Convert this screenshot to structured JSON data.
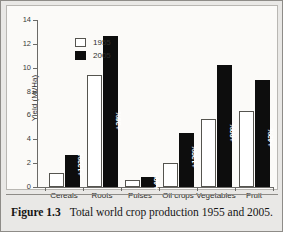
{
  "figure": {
    "caption_label": "Figure 1.3",
    "caption_text": "Total world crop production 1955 and 2005.",
    "frame_color": "#8e8c88",
    "background_color": "#e9e8e6",
    "panel_background": "#fbfaf8"
  },
  "legend": {
    "position": "top-left-inside",
    "items": [
      {
        "label": "1955",
        "swatch": "hollow-square",
        "color": "#ffffff"
      },
      {
        "label": "2005",
        "swatch": "filled-square",
        "color": "#0d0d0d"
      }
    ]
  },
  "axes": {
    "y_title": "Yield (Mt/Ha)",
    "y_ticks": [
      "0",
      "2",
      "4",
      "6",
      "8",
      "10",
      "12",
      "14"
    ],
    "y_min": 0,
    "y_max": 14,
    "x_title": ""
  },
  "chart_data": {
    "type": "bar",
    "title": "Total world crop production 1955 and 2005",
    "xlabel": "",
    "ylabel": "Yield (Mt/Ha)",
    "ylim": [
      0,
      14
    ],
    "ytick_step": 2,
    "grid": false,
    "legend_position": "upper left",
    "categories": [
      "Cereals",
      "Roots",
      "Pulses",
      "Oil crops",
      "Vegetables",
      "Fruit"
    ],
    "series": [
      {
        "name": "1955",
        "color": "#ffffff",
        "values": [
          1.2,
          9.35,
          0.6,
          2.0,
          5.7,
          6.4
        ]
      },
      {
        "name": "2005",
        "color": "#0d0d0d",
        "values": [
          2.65,
          12.7,
          0.85,
          4.5,
          10.2,
          8.95
        ]
      }
    ],
    "annotations": [
      {
        "category": "Cereals",
        "text": "+123%"
      },
      {
        "category": "Roots",
        "text": "+36%"
      },
      {
        "category": "Pulses",
        "text": "+40%"
      },
      {
        "category": "Oil crops",
        "text": "+130%"
      },
      {
        "category": "Vegetables",
        "text": "+80%"
      },
      {
        "category": "Fruit",
        "text": "+42%"
      }
    ]
  }
}
